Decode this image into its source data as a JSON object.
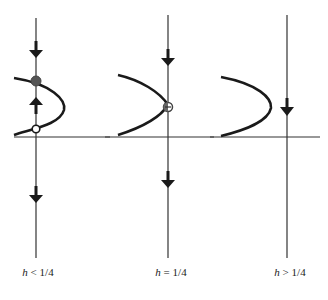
{
  "figure": {
    "panels": [
      {
        "id": "panel-1",
        "label_var": "h",
        "label_rel": " < 1/4",
        "vertical_axis_x": 36,
        "equilibria": [
          {
            "type": "stable",
            "marker": "filled",
            "y": 81
          },
          {
            "type": "unstable",
            "marker": "open",
            "y": 129
          }
        ],
        "arrows": [
          {
            "direction": "down",
            "y": 50
          },
          {
            "direction": "up",
            "y": 105
          },
          {
            "direction": "down",
            "y": 195
          }
        ]
      },
      {
        "id": "panel-2",
        "label_var": "h",
        "label_rel": " = 1/4",
        "vertical_axis_x": 168,
        "equilibria": [
          {
            "type": "semi-stable",
            "marker": "half-filled",
            "y": 107
          }
        ],
        "arrows": [
          {
            "direction": "down",
            "y": 58
          },
          {
            "direction": "down",
            "y": 180
          }
        ]
      },
      {
        "id": "panel-3",
        "label_var": "h",
        "label_rel": " > 1/4",
        "vertical_axis_x": 287,
        "equilibria": [],
        "arrows": [
          {
            "direction": "down",
            "y": 113
          }
        ]
      }
    ],
    "colors": {
      "line": "#333333",
      "curve": "#1a1a1a",
      "filled_dot": "#555555",
      "arrow": "#1a1a1a"
    }
  }
}
